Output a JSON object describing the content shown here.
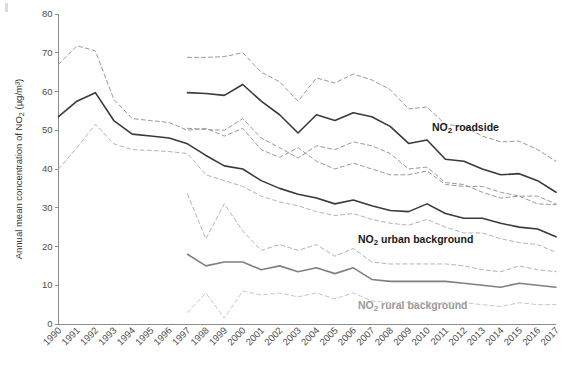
{
  "chart_data": {
    "type": "line",
    "title": "",
    "xlabel": "",
    "ylabel": "Annual mean concentration of NO₂ (µg/m³)",
    "ylim": [
      0,
      80
    ],
    "yticks": [
      0,
      10,
      20,
      30,
      40,
      50,
      60,
      70,
      80
    ],
    "grid": false,
    "legend_position": "inline-right",
    "categories": [
      "1990",
      "1991",
      "1992",
      "1993",
      "1994",
      "1995",
      "1996",
      "1997",
      "1998",
      "1999",
      "2000",
      "2001",
      "2002",
      "2003",
      "2004",
      "2005",
      "2006",
      "2007",
      "2008",
      "2009",
      "2010",
      "2011",
      "2012",
      "2013",
      "2014",
      "2015",
      "2016",
      "2017"
    ],
    "series": [
      {
        "name": "NO2 roadside",
        "label": "NO₂ roadside",
        "style": "solid",
        "color": "#3a3a3a",
        "x": [
          "1997",
          "1998",
          "1999",
          "2000",
          "2001",
          "2002",
          "2003",
          "2004",
          "2005",
          "2006",
          "2007",
          "2008",
          "2009",
          "2010",
          "2011",
          "2012",
          "2013",
          "2014",
          "2015",
          "2016",
          "2017"
        ],
        "values": [
          59.7,
          59.5,
          59.0,
          61.8,
          57.5,
          54.0,
          49.3,
          54.0,
          52.5,
          54.5,
          53.5,
          51.0,
          46.6,
          47.5,
          42.5,
          42.0,
          40.0,
          38.5,
          38.8,
          37.0,
          34.0
        ]
      },
      {
        "name": "NO2 roadside upper",
        "label": "",
        "style": "dashed",
        "color": "#9a9a9a",
        "x": [
          "1997",
          "1998",
          "1999",
          "2000",
          "2001",
          "2002",
          "2003",
          "2004",
          "2005",
          "2006",
          "2007",
          "2008",
          "2009",
          "2010",
          "2011",
          "2012",
          "2013",
          "2014",
          "2015",
          "2016",
          "2017"
        ],
        "values": [
          68.8,
          68.8,
          69.0,
          70.0,
          65.0,
          62.5,
          57.5,
          63.5,
          62.2,
          64.5,
          63.0,
          60.5,
          55.5,
          56.0,
          51.5,
          51.0,
          48.5,
          47.0,
          47.2,
          45.0,
          42.0
        ]
      },
      {
        "name": "NO2 roadside lower",
        "label": "",
        "style": "dashed",
        "color": "#9a9a9a",
        "x": [
          "1997",
          "1998",
          "1999",
          "2000",
          "2001",
          "2002",
          "2003",
          "2004",
          "2005",
          "2006",
          "2007",
          "2008",
          "2009",
          "2010",
          "2011",
          "2012",
          "2013",
          "2014",
          "2015",
          "2016",
          "2017"
        ],
        "values": [
          50.5,
          50.2,
          50.0,
          53.0,
          48.0,
          45.5,
          42.8,
          46.0,
          45.0,
          47.0,
          46.0,
          44.0,
          40.0,
          40.5,
          36.5,
          36.0,
          34.0,
          32.5,
          33.0,
          31.0,
          30.8
        ]
      },
      {
        "name": "NO2 urban background",
        "label": "NO₂ urban background",
        "style": "solid",
        "color": "#3a3a3a",
        "x": [
          "1990",
          "1991",
          "1992",
          "1993",
          "1994",
          "1995",
          "1996",
          "1997",
          "1998",
          "1999",
          "2000",
          "2001",
          "2002",
          "2003",
          "2004",
          "2005",
          "2006",
          "2007",
          "2008",
          "2009",
          "2010",
          "2011",
          "2012",
          "2013",
          "2014",
          "2015",
          "2016",
          "2017"
        ],
        "values": [
          53.5,
          57.5,
          59.7,
          52.5,
          49.0,
          48.5,
          48.0,
          46.5,
          43.5,
          40.8,
          40.0,
          37.0,
          35.0,
          33.5,
          32.5,
          31.0,
          32.0,
          30.5,
          29.3,
          29.0,
          31.0,
          28.5,
          27.3,
          27.3,
          26.0,
          25.0,
          24.5,
          22.5
        ]
      },
      {
        "name": "NO2 urban background upper",
        "label": "",
        "style": "dashed",
        "color": "#9a9a9a",
        "x": [
          "1990",
          "1991",
          "1992",
          "1993",
          "1994",
          "1995",
          "1996",
          "1997",
          "1998",
          "1999",
          "2000",
          "2001",
          "2002",
          "2003",
          "2004",
          "2005",
          "2006",
          "2007",
          "2008",
          "2009",
          "2010",
          "2011",
          "2012",
          "2013",
          "2014",
          "2015",
          "2016",
          "2017"
        ],
        "values": [
          67.0,
          71.8,
          70.5,
          58.0,
          53.0,
          52.5,
          52.0,
          50.0,
          50.5,
          48.5,
          50.5,
          45.0,
          43.0,
          45.5,
          42.0,
          40.0,
          41.5,
          40.0,
          38.5,
          38.5,
          39.5,
          36.0,
          35.5,
          35.5,
          34.0,
          33.0,
          33.0,
          31.0
        ]
      },
      {
        "name": "NO2 urban background lower",
        "label": "",
        "style": "dashed",
        "color": "#b4b4b4",
        "x": [
          "1990",
          "1991",
          "1992",
          "1993",
          "1994",
          "1995",
          "1996",
          "1997",
          "1998",
          "1999",
          "2000",
          "2001",
          "2002",
          "2003",
          "2004",
          "2005",
          "2006",
          "2007",
          "2008",
          "2009",
          "2010",
          "2011",
          "2012",
          "2013",
          "2014",
          "2015",
          "2016",
          "2017"
        ],
        "values": [
          40.0,
          45.5,
          51.5,
          46.5,
          45.0,
          44.8,
          44.5,
          44.0,
          38.5,
          37.0,
          35.5,
          33.0,
          31.5,
          30.5,
          29.0,
          28.0,
          28.5,
          27.0,
          26.0,
          25.5,
          27.0,
          25.0,
          23.5,
          23.5,
          22.0,
          21.0,
          20.5,
          18.5
        ]
      },
      {
        "name": "NO2 rural background",
        "label": "NO₂ rural background",
        "style": "solid",
        "color": "#808080",
        "x": [
          "1997",
          "1998",
          "1999",
          "2000",
          "2001",
          "2002",
          "2003",
          "2004",
          "2005",
          "2006",
          "2007",
          "2008",
          "2009",
          "2010",
          "2011",
          "2012",
          "2013",
          "2014",
          "2015",
          "2016",
          "2017"
        ],
        "values": [
          18.0,
          15.0,
          16.0,
          16.0,
          14.0,
          15.0,
          13.5,
          14.5,
          13.0,
          14.5,
          11.5,
          11.0,
          11.0,
          11.0,
          11.0,
          10.5,
          10.0,
          9.5,
          10.5,
          10.0,
          9.5
        ]
      },
      {
        "name": "NO2 rural background upper",
        "label": "",
        "style": "dashed",
        "color": "#b4b4b4",
        "x": [
          "1997",
          "1998",
          "1999",
          "2000",
          "2001",
          "2002",
          "2003",
          "2004",
          "2005",
          "2006",
          "2007",
          "2008",
          "2009",
          "2010",
          "2011",
          "2012",
          "2013",
          "2014",
          "2015",
          "2016",
          "2017"
        ],
        "values": [
          33.5,
          22.0,
          31.0,
          24.0,
          19.0,
          20.5,
          19.0,
          20.5,
          17.5,
          19.5,
          16.0,
          15.5,
          15.5,
          15.5,
          15.5,
          15.0,
          14.0,
          13.5,
          15.0,
          14.0,
          13.5
        ]
      },
      {
        "name": "NO2 rural background lower",
        "label": "",
        "style": "dashed",
        "color": "#c8c8c8",
        "x": [
          "1997",
          "1998",
          "1999",
          "2000",
          "2001",
          "2002",
          "2003",
          "2004",
          "2005",
          "2006",
          "2007",
          "2008",
          "2009",
          "2010",
          "2011",
          "2012",
          "2013",
          "2014",
          "2015",
          "2016",
          "2017"
        ],
        "values": [
          3.0,
          8.0,
          1.5,
          8.5,
          7.5,
          8.0,
          7.0,
          8.0,
          6.5,
          8.0,
          6.0,
          5.5,
          5.5,
          5.5,
          5.5,
          5.5,
          5.0,
          4.5,
          5.5,
          5.0,
          5.0
        ]
      }
    ],
    "annotations": [
      {
        "name": "roadside",
        "text": "NO₂ roadside",
        "x": 432,
        "y": 131,
        "color": "#1a1a1a"
      },
      {
        "name": "urban-background",
        "text": "NO₂ urban background",
        "x": 358,
        "y": 243,
        "color": "#1a1a1a"
      },
      {
        "name": "rural-background",
        "text": "NO₂ rural background",
        "x": 358,
        "y": 309,
        "color": "#9a9a9a"
      }
    ]
  },
  "colors": {
    "axis": "#8c8c8c",
    "tick_text": "#4d4d4d",
    "solid_dark": "#3a3a3a",
    "solid_grey": "#808080",
    "dashed_grey": "#9a9a9a",
    "dashed_light": "#c8c8c8",
    "background": "#ffffff"
  }
}
